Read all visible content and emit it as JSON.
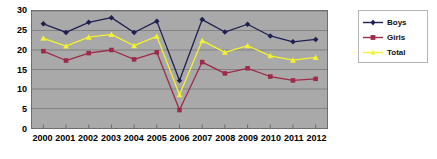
{
  "chart_data": {
    "type": "line",
    "title": "",
    "subtitle": "",
    "xlabel": "",
    "ylabel": "",
    "categories": [
      "2000",
      "2001",
      "2002",
      "2003",
      "2004",
      "2005",
      "2006",
      "2007",
      "2008",
      "2009",
      "2010",
      "2011",
      "2012"
    ],
    "series": [
      {
        "name": "Boys",
        "color": "#1f1f52",
        "marker": "diamond",
        "values": [
          26.7,
          24.5,
          27.1,
          28.3,
          24.5,
          27.4,
          12.2,
          27.8,
          24.6,
          26.6,
          23.6,
          22.1,
          22.7
        ]
      },
      {
        "name": "Girls",
        "color": "#9e2a4a",
        "marker": "square",
        "values": [
          19.7,
          17.3,
          19.2,
          20.0,
          17.6,
          19.4,
          4.6,
          16.9,
          14.0,
          15.3,
          13.2,
          12.2,
          12.6
        ]
      },
      {
        "name": "Total",
        "color": "#f2f22e",
        "marker": "triangle",
        "values": [
          23.0,
          21.0,
          23.3,
          24.0,
          21.1,
          23.5,
          8.5,
          22.4,
          19.4,
          21.1,
          18.5,
          17.4,
          18.1
        ]
      }
    ],
    "ylim": [
      0,
      30
    ],
    "yticks": [
      0,
      5,
      10,
      15,
      20,
      25,
      30
    ],
    "ytick_labels": [
      "0",
      "5",
      "10",
      "15",
      "20",
      "25",
      "30"
    ],
    "grid": "horizontal",
    "legend_position": "right",
    "plot_background": "#a9a9a9",
    "grid_color": "#787878",
    "page_background": "#ffffff"
  },
  "legend": {
    "items": [
      {
        "label": "Boys"
      },
      {
        "label": "Girls"
      },
      {
        "label": "Total"
      }
    ]
  }
}
